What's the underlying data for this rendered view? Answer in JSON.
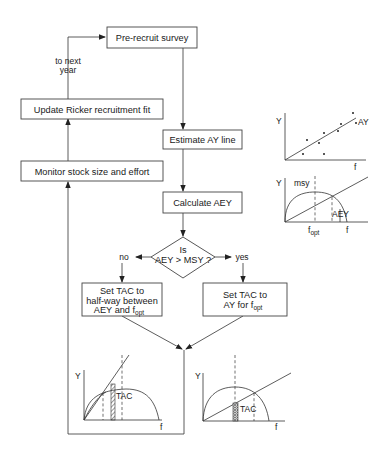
{
  "flowchart": {
    "pre_recruit": "Pre-recruit survey",
    "to_next_year_1": "to next",
    "to_next_year_2": "year",
    "update_ricker": "Update Ricker recruitment fit",
    "monitor": "Monitor stock size and effort",
    "estimate_ay": "Estimate AY line",
    "calculate_aey": "Calculate AEY",
    "decision_line1": "Is",
    "decision_line2": "AEY > MSY ?",
    "no_label": "no",
    "yes_label": "yes",
    "no_action_line1": "Set TAC to",
    "no_action_line2": "half-way between",
    "no_action_line3_main": "AEY and f",
    "no_action_line3_sub": "opt",
    "yes_action_line1": "Set TAC to",
    "yes_action_line2_main": "AY for f",
    "yes_action_line2_sub": "opt"
  },
  "chart_ay": {
    "y_label": "Y",
    "x_label": "f",
    "line_label": "AY"
  },
  "chart_msy": {
    "y_label": "Y",
    "x_label": "f",
    "msy_label": "msy",
    "fopt_main": "f",
    "fopt_sub": "opt",
    "aey_label": "AEY"
  },
  "chart_no": {
    "y_label": "Y",
    "x_label": "f",
    "tac_label": "TAC"
  },
  "chart_yes": {
    "y_label": "Y",
    "x_label": "f",
    "tac_label": "TAC"
  }
}
